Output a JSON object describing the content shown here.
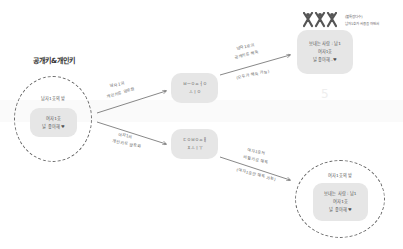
{
  "title": "공개키&개인키",
  "sender_circle": {
    "heading": "남자1호의 방",
    "box_lines": [
      "여자1호",
      "널 좋아해 ♥"
    ]
  },
  "arrows": {
    "top_left": [
      "남자1의",
      "개인키로 암호화"
    ],
    "bottom_left": [
      "여자1의",
      "개인키로 암호화"
    ],
    "top_right": [
      "남자1호의",
      "공개키로 해독",
      "(모두가 해독 가능)"
    ],
    "bottom_right": [
      "여자1호의",
      "비밀키로 해독",
      "(여자1호만 해독 가능)"
    ]
  },
  "cipher_top": {
    "lines": [
      "ㅂㅡㅇㅆㅓㅇ",
      "ㅗㅣㅇ"
    ]
  },
  "cipher_bottom": {
    "lines": [
      "ㄷㅇㅂㅇㅆㅐ",
      "ㅊㅗㅣㅜ"
    ]
  },
  "public_group": {
    "caption": [
      "(불특정다수)",
      "남자1호가 사용을 하면서"
    ],
    "box_lines": [
      "보내는 사람 : 남1",
      "여자1호",
      "널 좋아해..♥"
    ]
  },
  "receiver_circle": {
    "heading": "여자1호의 방",
    "box_lines": [
      "보내는 사람 : 남1",
      "여자1호",
      "널 좋아해 ♥"
    ]
  },
  "watermark": "5",
  "colors": {
    "box": "#e6e6e6",
    "line": "#555555",
    "text": "#555555"
  }
}
